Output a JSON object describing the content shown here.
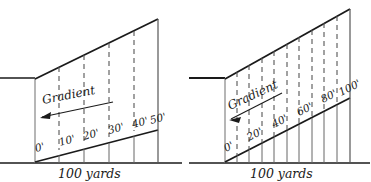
{
  "figure": {
    "background": "#ffffff",
    "ink": "#1a1a1a",
    "dash_color": "#555555"
  },
  "panels": [
    {
      "id": "left-panel",
      "name": "gradient-diagram-1-in-6",
      "gradient_label": "Gradient",
      "arrow_direction": "left",
      "baseline_label": "100 yards",
      "rise_labels": [
        "0'",
        "10'",
        "20'",
        "30'",
        "40'",
        "50'"
      ],
      "divisions": 5,
      "total_rise_feet": 50,
      "run_yards": 100,
      "geometry": {
        "ground_y": 163,
        "stub_x1": 0,
        "stub_x2": 35,
        "stub_y": 78,
        "left_x": 35,
        "right_x": 158,
        "slope_left_y": 79,
        "slope_right_y": 19,
        "base_left_y": 162,
        "base_right_y": 130,
        "dash_x": [
          59,
          84,
          109,
          134
        ],
        "label_x": [
          36,
          61,
          86,
          111,
          136,
          155
        ]
      }
    },
    {
      "id": "right-panel",
      "name": "gradient-diagram-1-in-3",
      "gradient_label": "Gradient",
      "arrow_direction": "left",
      "baseline_label": "100 yards",
      "rise_labels": [
        "0'",
        "20'",
        "40'",
        "60'",
        "80'",
        "100'"
      ],
      "divisions": 10,
      "total_rise_feet": 100,
      "run_yards": 100,
      "geometry": {
        "ground_y": 163,
        "stub_x1": 185,
        "stub_x2": 225,
        "stub_y": 78,
        "left_x": 225,
        "right_x": 350,
        "slope_left_y": 79,
        "slope_right_y": 9,
        "base_left_y": 162,
        "base_right_y": 98,
        "dash_x": [
          237,
          249,
          262,
          274,
          287,
          299,
          312,
          324,
          337
        ],
        "label_x": [
          226,
          251,
          276,
          301,
          325,
          342
        ]
      }
    }
  ]
}
